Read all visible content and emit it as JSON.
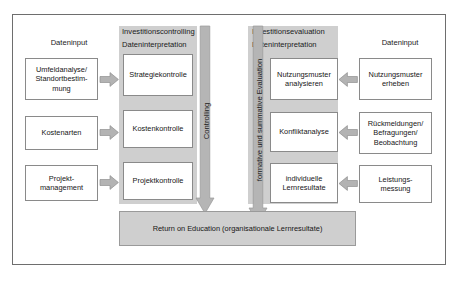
{
  "diagram": {
    "title_hidden": "",
    "colors": {
      "frame_border": "#6e6e6e",
      "panel_grey": "#cfcfcf",
      "arrow_grey": "#b3b3b3",
      "arrow_border": "#8f8f8f",
      "box_border": "#8a8a8a",
      "text": "#161616",
      "background": "#ffffff"
    },
    "left_column": {
      "header": "Dateninput",
      "items": [
        {
          "lines": [
            "Umfeldanalyse/",
            "Standortbestim-",
            "mung"
          ]
        },
        {
          "lines": [
            "Kostenarten"
          ]
        },
        {
          "lines": [
            "Projekt-",
            "management"
          ]
        }
      ]
    },
    "left_panel": {
      "header_top": "Investitionscontrolling",
      "header_sub": "Dateninterpretation",
      "items": [
        {
          "lines": [
            "Strategiekontrolle"
          ]
        },
        {
          "lines": [
            "Kostenkontrolle"
          ]
        },
        {
          "lines": [
            "Projektkontrolle"
          ]
        }
      ]
    },
    "left_vertical_arrow": {
      "label": "Controlling"
    },
    "right_vertical_arrow": {
      "label": "formative und summative Evaluation"
    },
    "right_panel": {
      "header_top": "Investitionsevaluation",
      "header_sub": "Dateninterpretation",
      "items": [
        {
          "lines": [
            "Nutzungsmuster",
            "analysieren"
          ]
        },
        {
          "lines": [
            "Konfliktanalyse"
          ]
        },
        {
          "lines": [
            "individuelle",
            "Lernresultate"
          ]
        }
      ]
    },
    "right_column": {
      "header": "Dateninput",
      "items": [
        {
          "lines": [
            "Nutzungsmuster",
            "erheben"
          ]
        },
        {
          "lines": [
            "Rückmeldungen/",
            "Befragungen/",
            "Beobachtung"
          ]
        },
        {
          "lines": [
            "Leistungs-",
            "messung"
          ]
        }
      ]
    },
    "result": {
      "lines": [
        "Return on Education",
        "(organisationale Lernresultate)"
      ]
    }
  }
}
